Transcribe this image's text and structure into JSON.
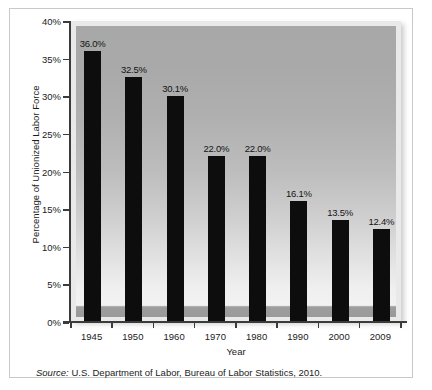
{
  "chart_data": {
    "type": "bar",
    "title": "",
    "subtitle": "",
    "xlabel": "Year",
    "ylabel": "Percentage of Unionized Labor Force",
    "categories": [
      "1945",
      "1950",
      "1960",
      "1970",
      "1980",
      "1990",
      "2000",
      "2009"
    ],
    "values": [
      36.0,
      32.5,
      30.1,
      22.0,
      22.0,
      16.1,
      13.5,
      12.4
    ],
    "data_labels": [
      "36.0%",
      "32.5%",
      "30.1%",
      "22.0%",
      "22.0%",
      "16.1%",
      "13.5%",
      "12.4%"
    ],
    "ylim": [
      0,
      40
    ],
    "ytick_values": [
      0,
      5,
      10,
      15,
      20,
      25,
      30,
      35,
      40
    ],
    "ytick_labels": [
      "0%",
      "5%",
      "10%",
      "15%",
      "20%",
      "25%",
      "30%",
      "35%",
      "40%"
    ],
    "grid": false,
    "legend": null,
    "bar_color": "#0d0d0d",
    "plot_background": "gradient-gray",
    "series": [
      {
        "name": "Percentage of Unionized Labor Force",
        "values": [
          36.0,
          32.5,
          30.1,
          22.0,
          22.0,
          16.1,
          13.5,
          12.4
        ]
      }
    ]
  },
  "source": {
    "label": "Source:",
    "text": " U.S. Department of Labor, Bureau of Labor Statistics, 2010."
  }
}
